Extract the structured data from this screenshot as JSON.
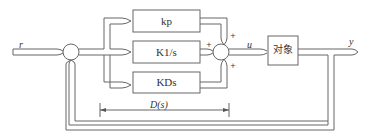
{
  "diagram": {
    "type": "pid-control-block-diagram",
    "signals": {
      "input": "r",
      "control": "u",
      "output": "y"
    },
    "blocks": [
      {
        "id": "proportional",
        "label": "kp"
      },
      {
        "id": "integral",
        "label": "K1/s"
      },
      {
        "id": "derivative",
        "label": "KDs"
      },
      {
        "id": "plant",
        "label": "对象"
      }
    ],
    "summing_junction_2_signs": [
      "+",
      "+",
      "+"
    ],
    "controller_span_label": "D(s)",
    "colors": {
      "line": "#555555",
      "text": "#333333",
      "background": "#ffffff"
    }
  }
}
